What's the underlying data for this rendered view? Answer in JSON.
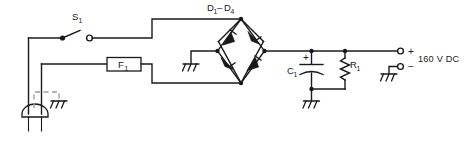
{
  "diagram": {
    "type": "schematic",
    "background_color": "#ffffff",
    "line_color": "#1a1a1a",
    "dashed_color": "#9a9a9a"
  },
  "labels": {
    "switch": {
      "base": "S",
      "sub": "1",
      "full": "S1"
    },
    "fuse": {
      "base": "F",
      "sub": "1",
      "full": "F1"
    },
    "diodes": {
      "base_from": "D",
      "sub_from": "1",
      "dash": "–",
      "base_to": "D",
      "sub_to": "4",
      "full": "D1-D4"
    },
    "capacitor": {
      "base": "C",
      "sub": "1",
      "full": "C1"
    },
    "resistor": {
      "base": "R",
      "sub": "1",
      "full": "R1"
    },
    "cap_polarity": "+",
    "output_plus": "+",
    "output_minus": "−",
    "output_rating": "160 V DC"
  },
  "components": [
    {
      "name": "ac-plug",
      "kind": "plug",
      "label": ""
    },
    {
      "name": "switch-s1",
      "kind": "spst-switch",
      "label": "S1"
    },
    {
      "name": "fuse-f1",
      "kind": "fuse",
      "label": "F1"
    },
    {
      "name": "bridge-rectifier",
      "kind": "diode-bridge",
      "label": "D1-D4",
      "diode_count": 4
    },
    {
      "name": "capacitor-c1",
      "kind": "electrolytic-capacitor",
      "label": "C1",
      "polarity": "+"
    },
    {
      "name": "resistor-r1",
      "kind": "resistor",
      "label": "R1"
    },
    {
      "name": "output-terminal-positive",
      "kind": "terminal",
      "label": "+"
    },
    {
      "name": "output-terminal-negative",
      "kind": "terminal",
      "label": "−"
    }
  ],
  "grounds": [
    {
      "name": "ground-chassis-plug"
    },
    {
      "name": "ground-bridge-left"
    },
    {
      "name": "ground-filter"
    },
    {
      "name": "ground-output-negative"
    }
  ]
}
